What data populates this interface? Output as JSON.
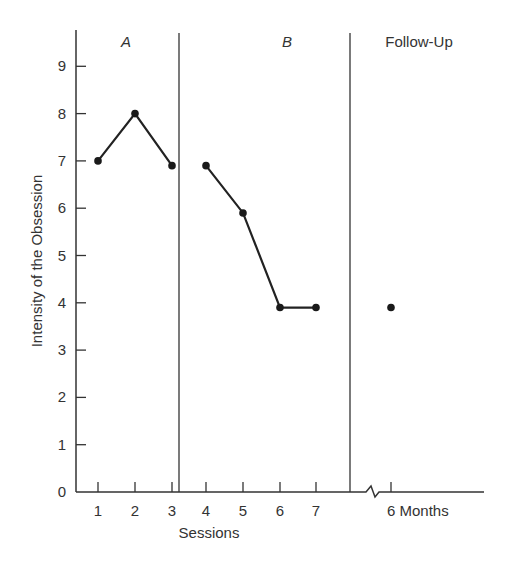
{
  "chart_data": {
    "type": "line",
    "title": "",
    "xlabel": "Sessions",
    "ylabel": "Intensity of the Obsession",
    "ylim": [
      0,
      9.7
    ],
    "y_ticks": [
      "0",
      "1",
      "2",
      "3",
      "4",
      "5",
      "6",
      "7",
      "8",
      "9"
    ],
    "x_tick_labels": [
      "1",
      "2",
      "3",
      "4",
      "5",
      "6",
      "7",
      "6 Months"
    ],
    "grid": false,
    "phases": [
      {
        "label": "A",
        "italic": true,
        "sessions": [
          1,
          2,
          3
        ]
      },
      {
        "label": "B",
        "italic": true,
        "sessions": [
          4,
          5,
          6,
          7
        ]
      },
      {
        "label": "Follow-Up",
        "italic": false,
        "sessions": [
          "6 Months"
        ]
      }
    ],
    "series": [
      {
        "name": "Phase A",
        "x": [
          1,
          2,
          3
        ],
        "values": [
          7,
          8,
          6.9
        ]
      },
      {
        "name": "Phase B",
        "x": [
          4,
          5,
          6,
          7
        ],
        "values": [
          6.9,
          5.9,
          3.9,
          3.9
        ]
      },
      {
        "name": "Follow-Up",
        "x": [
          "6 Months"
        ],
        "values": [
          3.9
        ]
      }
    ],
    "annotations": [
      "axis break between session 7 and 6 Months follow-up"
    ]
  }
}
